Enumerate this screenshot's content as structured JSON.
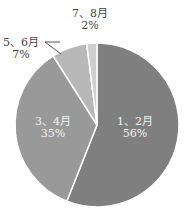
{
  "chart_data": {
    "type": "pie",
    "title": "",
    "categories": [
      "1、2月",
      "3、4月",
      "5、6月",
      "7、8月"
    ],
    "values": [
      56,
      35,
      7,
      2
    ],
    "labels": [
      "56%",
      "35%",
      "7%",
      "2%"
    ],
    "colors": [
      "#7f7f7f",
      "#999999",
      "#b8b8b8",
      "#cfcfcf"
    ],
    "start_angle_deg": 0,
    "direction": "clockwise",
    "separator_color": "#ffffff",
    "legend": "none"
  },
  "labels": {
    "s0": {
      "name": "1、2月",
      "pct": "56%"
    },
    "s1": {
      "name": "3、4月",
      "pct": "35%"
    },
    "s2": {
      "name": "5、6月",
      "pct": "7%"
    },
    "s3": {
      "name": "7、8月",
      "pct": "2%"
    }
  }
}
